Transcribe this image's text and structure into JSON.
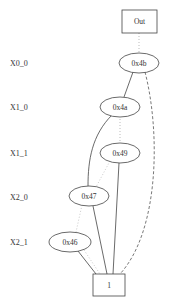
{
  "diagram": {
    "type": "BDD",
    "levels": [
      {
        "label": "X0_0",
        "y": 63
      },
      {
        "label": "X1_0",
        "y": 107
      },
      {
        "label": "X1_1",
        "y": 153
      },
      {
        "label": "X2_0",
        "y": 197
      },
      {
        "label": "X2_1",
        "y": 242
      }
    ],
    "nodes": {
      "out": {
        "label": "Out",
        "shape": "box"
      },
      "n4b": {
        "label": "0x4b",
        "shape": "ellipse"
      },
      "n4a": {
        "label": "0x4a",
        "shape": "ellipse"
      },
      "n49": {
        "label": "0x49",
        "shape": "ellipse"
      },
      "n47": {
        "label": "0x47",
        "shape": "ellipse"
      },
      "n46": {
        "label": "0x46",
        "shape": "ellipse"
      },
      "one": {
        "label": "1",
        "shape": "box"
      }
    },
    "edges": [
      {
        "from": "Out",
        "to": "0x4b",
        "style": "dotted"
      },
      {
        "from": "0x4b",
        "to": "0x4a",
        "style": "solid"
      },
      {
        "from": "0x4b",
        "to": "1",
        "style": "dashed"
      },
      {
        "from": "0x4a",
        "to": "0x49",
        "style": "dotted"
      },
      {
        "from": "0x4a",
        "to": "0x47",
        "style": "solid"
      },
      {
        "from": "0x49",
        "to": "0x47",
        "style": "dotted"
      },
      {
        "from": "0x49",
        "to": "1",
        "style": "solid"
      },
      {
        "from": "0x47",
        "to": "0x46",
        "style": "dotted"
      },
      {
        "from": "0x47",
        "to": "1",
        "style": "solid"
      },
      {
        "from": "0x46",
        "to": "1",
        "style": "solid"
      },
      {
        "from": "0x46",
        "to": "1",
        "style": "dotted"
      }
    ],
    "colors": {
      "stroke": "#333333",
      "fill": "#ffffff",
      "edge_light": "#aaaaaa"
    }
  }
}
